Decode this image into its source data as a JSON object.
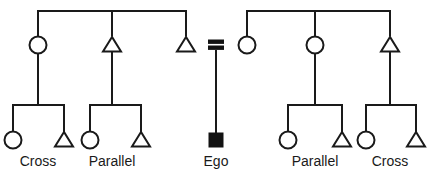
{
  "diagram": {
    "type": "kinship-diagram",
    "width": 430,
    "height": 178,
    "background_color": "#ffffff",
    "line_color": "#1a1a1a",
    "filled_color": "#121212",
    "symbol_legend": {
      "circle": "female",
      "triangle": "male",
      "filled_square": "ego",
      "equals_sign": "marriage-union",
      "horizontal_bar": "sibling-link",
      "vertical_line": "descent-link"
    },
    "generations": [
      {
        "name": "grandparent-sibling-set-left",
        "bar": {
          "x1": 38,
          "x2": 186,
          "y": 11
        },
        "members": [
          {
            "id": "g1-left-1",
            "symbol": "circle",
            "sex": "female",
            "x": 38,
            "y": 45,
            "has_descent_line": true
          },
          {
            "id": "g1-left-2",
            "symbol": "triangle",
            "sex": "male",
            "x": 112,
            "y": 45,
            "has_descent_line": true
          },
          {
            "id": "g1-left-3",
            "symbol": "triangle",
            "sex": "male",
            "x": 186,
            "y": 45,
            "has_descent_line": false
          }
        ]
      },
      {
        "name": "grandparent-sibling-set-right",
        "bar": {
          "x1": 247,
          "x2": 390,
          "y": 11
        },
        "members": [
          {
            "id": "g1-right-1",
            "symbol": "circle",
            "sex": "female",
            "x": 247,
            "y": 45,
            "has_descent_line": false
          },
          {
            "id": "g1-right-2",
            "symbol": "circle",
            "sex": "female",
            "x": 315,
            "y": 45,
            "has_descent_line": true
          },
          {
            "id": "g1-right-3",
            "symbol": "triangle",
            "sex": "male",
            "x": 390,
            "y": 45,
            "has_descent_line": true
          }
        ]
      }
    ],
    "marriage": {
      "id": "parents-marriage",
      "symbol": "equals",
      "x": 216,
      "y": 45,
      "spouse_left": "g1-left-3",
      "spouse_right": "g1-right-1",
      "descent_line": {
        "x": 216,
        "y1": 50,
        "y2": 134
      }
    },
    "cousin_groups": [
      {
        "id": "cousins-left-outer",
        "label": "Cross",
        "label_x": 38,
        "label_y": 166,
        "parent_x": 38,
        "bar": {
          "x1": 13,
          "x2": 64,
          "y": 105
        },
        "children": [
          {
            "symbol": "circle",
            "sex": "female",
            "x": 13,
            "y": 140
          },
          {
            "symbol": "triangle",
            "sex": "male",
            "x": 64,
            "y": 140
          }
        ]
      },
      {
        "id": "cousins-left-inner",
        "label": "Parallel",
        "label_x": 112,
        "label_y": 166,
        "parent_x": 112,
        "bar": {
          "x1": 90,
          "x2": 141,
          "y": 105
        },
        "children": [
          {
            "symbol": "circle",
            "sex": "female",
            "x": 90,
            "y": 140
          },
          {
            "symbol": "triangle",
            "sex": "male",
            "x": 141,
            "y": 140
          }
        ]
      },
      {
        "id": "cousins-right-inner",
        "label": "Parallel",
        "label_x": 315,
        "label_y": 166,
        "parent_x": 315,
        "bar": {
          "x1": 288,
          "x2": 342,
          "y": 105
        },
        "children": [
          {
            "symbol": "circle",
            "sex": "female",
            "x": 288,
            "y": 140
          },
          {
            "symbol": "triangle",
            "sex": "male",
            "x": 342,
            "y": 140
          }
        ]
      },
      {
        "id": "cousins-right-outer",
        "label": "Cross",
        "label_x": 390,
        "label_y": 166,
        "parent_x": 390,
        "bar": {
          "x1": 366,
          "x2": 416,
          "y": 105
        },
        "children": [
          {
            "symbol": "circle",
            "sex": "female",
            "x": 366,
            "y": 140
          },
          {
            "symbol": "triangle",
            "sex": "male",
            "x": 416,
            "y": 140
          }
        ]
      }
    ],
    "ego": {
      "id": "ego-node",
      "label": "Ego",
      "label_x": 216,
      "label_y": 166,
      "symbol": "filled-square",
      "x": 216,
      "y": 140,
      "size": 13
    },
    "labels": [
      {
        "text": "Cross",
        "x": 38
      },
      {
        "text": "Parallel",
        "x": 112
      },
      {
        "text": "Ego",
        "x": 216
      },
      {
        "text": "Parallel",
        "x": 315
      },
      {
        "text": "Cross",
        "x": 390
      }
    ]
  }
}
